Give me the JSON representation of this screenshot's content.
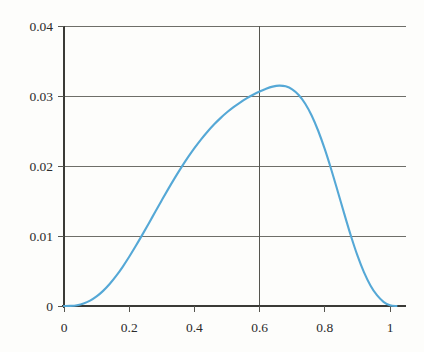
{
  "figure": {
    "background_color": "#fdfdfb",
    "axis_color": "#3a3a36",
    "grid_color": "#6e6e68",
    "curve_color": "#55a8d6"
  },
  "axes": {
    "x_ticks": [
      "0",
      "0.2",
      "0.4",
      "0.6",
      "0.8",
      "1"
    ],
    "x_tick_values": [
      0,
      0.2,
      0.4,
      0.6,
      0.8,
      1
    ],
    "y_ticks": [
      "0",
      "0.01",
      "0.02",
      "0.03",
      "0.04"
    ],
    "y_tick_values": [
      0,
      0.01,
      0.02,
      0.03,
      0.04
    ]
  },
  "annotations": {
    "peak_marker_x": 0.6
  },
  "chart_data": {
    "type": "line",
    "title": "",
    "subtitle": "",
    "xlabel": "",
    "ylabel": "",
    "xlim": [
      0,
      1.05
    ],
    "ylim": [
      0,
      0.04
    ],
    "grid": "horizontal",
    "legend": "none",
    "xticks": [
      0,
      0.2,
      0.4,
      0.6,
      0.8,
      1
    ],
    "xticklabels": [
      "0",
      "0.2",
      "0.4",
      "0.6",
      "0.8",
      "1"
    ],
    "yticks": [
      0,
      0.01,
      0.02,
      0.03,
      0.04
    ],
    "yticklabels": [
      "0",
      "0.01",
      "0.02",
      "0.03",
      "0.04"
    ],
    "annotations": [
      {
        "type": "vline",
        "x": 0.6,
        "label": "",
        "color": "#55554f"
      }
    ],
    "series": [
      {
        "name": "density",
        "color": "#55a8d6",
        "x": [
          0.0,
          0.02,
          0.04,
          0.06,
          0.08,
          0.1,
          0.12,
          0.14,
          0.16,
          0.18,
          0.2,
          0.22,
          0.24,
          0.26,
          0.28,
          0.3,
          0.32,
          0.34,
          0.36,
          0.38,
          0.4,
          0.42,
          0.44,
          0.46,
          0.48,
          0.5,
          0.52,
          0.54,
          0.56,
          0.58,
          0.6,
          0.62,
          0.64,
          0.66,
          0.68,
          0.7,
          0.72,
          0.74,
          0.76,
          0.78,
          0.8,
          0.82,
          0.84,
          0.86,
          0.88,
          0.9,
          0.92,
          0.94,
          0.96,
          0.98,
          1.0,
          1.02
        ],
        "y": [
          0.0,
          2e-05,
          0.00012,
          0.00036,
          0.00077,
          0.00137,
          0.00216,
          0.00314,
          0.00429,
          0.0056,
          0.00703,
          0.00856,
          0.01016,
          0.0118,
          0.01346,
          0.01511,
          0.01673,
          0.0183,
          0.0198,
          0.02122,
          0.02255,
          0.02378,
          0.0249,
          0.02592,
          0.02684,
          0.02767,
          0.02841,
          0.02907,
          0.02966,
          0.03018,
          0.03064,
          0.03104,
          0.03134,
          0.03148,
          0.03138,
          0.03096,
          0.03015,
          0.0289,
          0.02718,
          0.025,
          0.0224,
          0.01947,
          0.01632,
          0.01312,
          0.01003,
          0.00722,
          0.00484,
          0.00294,
          0.00154,
          0.0006,
          0.0001,
          0.0
        ],
        "peak": {
          "x": 0.6,
          "y": 0.0345
        }
      }
    ]
  }
}
